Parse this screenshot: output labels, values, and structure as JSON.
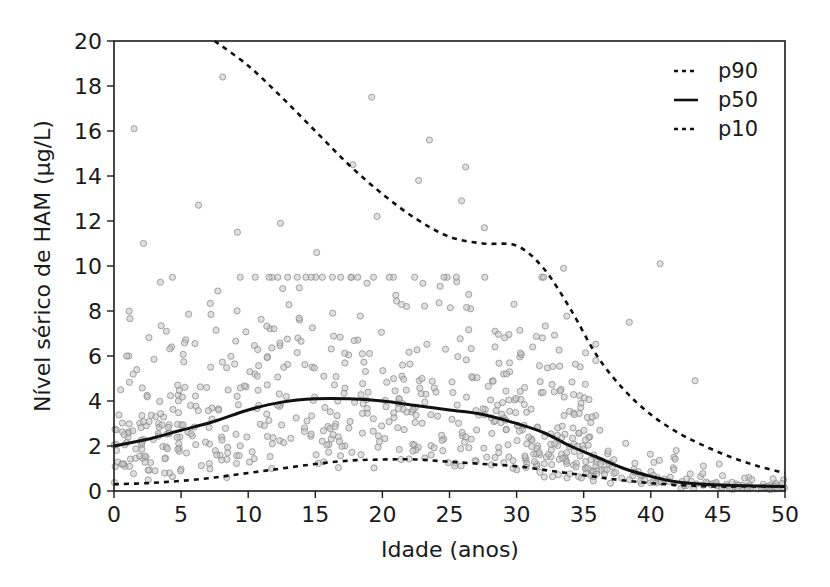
{
  "chart_data": {
    "type": "scatter",
    "title": "",
    "xlabel": "Idade (anos)",
    "ylabel": "Nível sérico de HAM (µg/L)",
    "xlim": [
      0,
      50
    ],
    "ylim": [
      0,
      20
    ],
    "xticks": [
      0,
      5,
      10,
      15,
      20,
      25,
      30,
      35,
      40,
      45,
      50
    ],
    "yticks": [
      0,
      2,
      4,
      6,
      8,
      10,
      12,
      14,
      16,
      18,
      20
    ],
    "grid": false,
    "legend_position": "top-right",
    "legend": [
      {
        "name": "p90",
        "style": "dashed"
      },
      {
        "name": "p50",
        "style": "solid"
      },
      {
        "name": "p10",
        "style": "dashed"
      }
    ],
    "series": [
      {
        "name": "p90",
        "style": "dashed",
        "x": [
          7.5,
          10,
          12.5,
          15,
          17.5,
          20,
          22.5,
          25,
          27.5,
          30,
          32,
          34,
          36,
          38,
          40,
          42,
          44,
          46,
          48,
          50
        ],
        "y": [
          20,
          18.9,
          17.5,
          16.0,
          14.5,
          13.2,
          12.1,
          11.3,
          11.0,
          10.9,
          9.9,
          8.1,
          6.0,
          4.5,
          3.4,
          2.6,
          2.0,
          1.5,
          1.1,
          0.8
        ]
      },
      {
        "name": "p50",
        "style": "solid",
        "x": [
          0,
          2.5,
          5,
          7.5,
          10,
          12.5,
          15,
          17.5,
          20,
          22.5,
          25,
          27.5,
          30,
          32,
          34,
          36,
          38,
          40,
          42,
          44,
          46,
          48,
          50
        ],
        "y": [
          2.0,
          2.3,
          2.7,
          3.1,
          3.6,
          3.95,
          4.1,
          4.1,
          4.0,
          3.8,
          3.6,
          3.4,
          3.0,
          2.6,
          2.0,
          1.5,
          1.0,
          0.65,
          0.4,
          0.3,
          0.25,
          0.22,
          0.2
        ]
      },
      {
        "name": "p10",
        "style": "dashed",
        "x": [
          0,
          2.5,
          5,
          7.5,
          10,
          12.5,
          15,
          17.5,
          20,
          22.5,
          25,
          27.5,
          30,
          32.5,
          35,
          37.5,
          40,
          42.5,
          45,
          47.5,
          50
        ],
        "y": [
          0.3,
          0.35,
          0.45,
          0.6,
          0.8,
          1.0,
          1.2,
          1.35,
          1.4,
          1.4,
          1.3,
          1.2,
          1.1,
          0.9,
          0.7,
          0.5,
          0.35,
          0.25,
          0.2,
          0.2,
          0.2
        ]
      },
      {
        "name": "observations",
        "style": "points",
        "x": [
          1.5,
          8.1,
          2.2,
          6.3,
          1.1,
          3.9,
          0.5,
          9.2,
          12.4,
          15.1,
          17.8,
          19.6,
          21.0,
          22.7,
          24.3,
          25.9,
          27.6,
          29.8,
          31.2,
          33.5,
          35.9,
          38.4,
          40.7,
          43.3,
          19.2,
          23.5,
          26.2,
          21.8,
          28.4,
          16.3,
          13.7,
          18.5,
          10.5,
          7.2,
          4.8,
          3.1,
          2.4,
          5.7,
          9.9,
          11.8,
          14.2,
          24.7,
          30.6,
          34.8,
          36.2,
          41.9,
          45.1,
          47.3
        ],
        "y": [
          16.1,
          18.4,
          11.0,
          12.7,
          6.0,
          7.1,
          4.5,
          11.5,
          11.9,
          10.6,
          14.5,
          12.2,
          8.7,
          13.8,
          9.1,
          12.9,
          11.7,
          8.3,
          6.4,
          9.9,
          5.8,
          7.5,
          10.1,
          4.9,
          17.5,
          15.6,
          14.4,
          8.2,
          7.1,
          7.9,
          6.8,
          6.1,
          5.2,
          5.5,
          4.0,
          3.3,
          2.9,
          3.8,
          2.4,
          2.1,
          2.8,
          6.3,
          4.6,
          3.9,
          2.7,
          1.8,
          1.2,
          0.6
        ]
      }
    ]
  },
  "axes": {
    "y_title": "Nível sérico de HAM (µg/L)",
    "x_title": "Idade (anos)",
    "y_ticks": [
      "0",
      "2",
      "4",
      "6",
      "8",
      "10",
      "12",
      "14",
      "16",
      "18",
      "20"
    ],
    "x_ticks": [
      "0",
      "5",
      "10",
      "15",
      "20",
      "25",
      "30",
      "35",
      "40",
      "45",
      "50"
    ]
  },
  "legend": {
    "items": [
      "p90",
      "p50",
      "p10"
    ]
  },
  "colors": {
    "axis": "#1a1a1a",
    "curve": "#111111",
    "points": "#8a8a8a"
  }
}
